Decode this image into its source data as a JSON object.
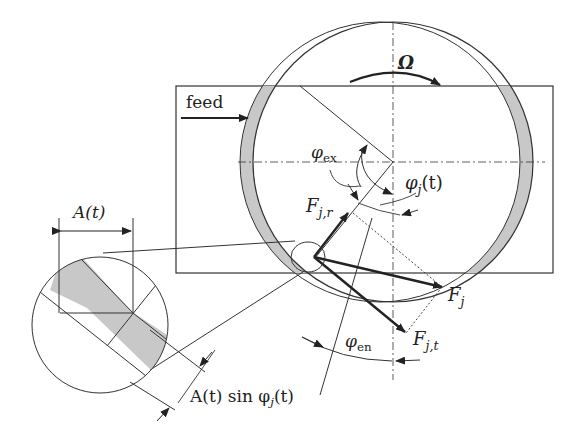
{
  "diagram": {
    "labels": {
      "feed": "feed",
      "omega": "Ω",
      "phi_ex": "φ",
      "phi_ex_sub": "ex",
      "phi_j": "φ",
      "phi_j_sub": "j",
      "phi_j_arg": "(t)",
      "phi_en": "φ",
      "phi_en_sub": "en",
      "F_jr": "F",
      "F_jr_sub": "j,r",
      "F_j": "F",
      "F_j_sub": "j",
      "F_jt": "F",
      "F_jt_sub": "j,t",
      "A_t": "A(t)",
      "A_sin": "A(t) sin φ",
      "A_sin_sub": "j",
      "A_sin_arg": "(t)"
    },
    "colors": {
      "line": "#333333",
      "chip_fill": "#c8c8c8",
      "background": "#ffffff"
    }
  }
}
